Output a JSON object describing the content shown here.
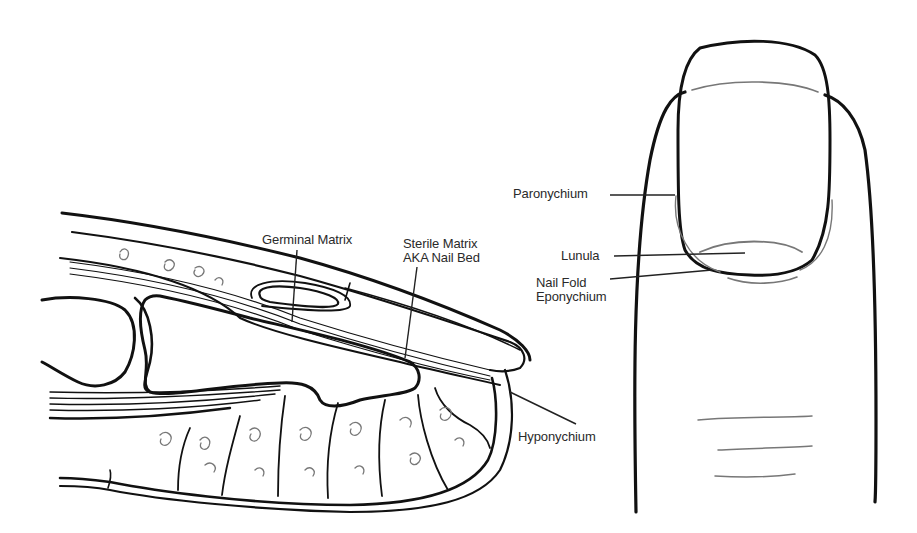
{
  "diagram": {
    "title": "",
    "panels": [
      {
        "id": "sagittal-section",
        "description": "Sagittal cross-section of fingertip showing nail unit"
      },
      {
        "id": "dorsal-view",
        "description": "Dorsal view of fingertip and nail"
      }
    ],
    "labels": {
      "germinal_matrix": "Germinal Matrix",
      "sterile_matrix_line1": "Sterile Matrix",
      "sterile_matrix_line2": "AKA Nail Bed",
      "hyponychium": "Hyponychium",
      "paronychium": "Paronychium",
      "lunula": "Lunula",
      "nail_fold_line1": "Nail Fold",
      "nail_fold_line2": "Eponychium"
    },
    "colors": {
      "ink": "#111111",
      "text": "#2a2a2a",
      "background": "#ffffff"
    }
  }
}
